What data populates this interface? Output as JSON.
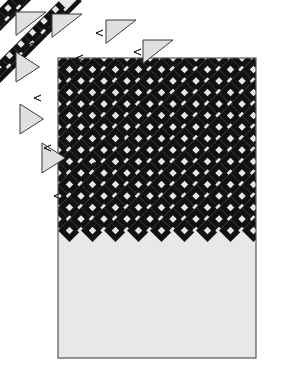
{
  "diagram": {
    "title": "Diagonal-set quilt assembly diagram",
    "kind": "quilt-block-layout",
    "canvas": {
      "width": 285,
      "height": 374
    },
    "colors": {
      "page_background": "#ffffff",
      "quilt_background": "#e8e8e8",
      "patch_dark": "#111111",
      "patch_light": "#e6e6e6",
      "setting_triangle_fill": "#e0e0e0",
      "outline": "#3a3a3a",
      "border": "#555555"
    },
    "quilt_top": {
      "name": "main-quilt-body",
      "x": 58,
      "y": 58,
      "width": 198,
      "height": 300,
      "border_width": 1.2
    },
    "lattice": {
      "description": "45-degree diagonal grid of dark on-point blocks with small light diamonds",
      "cell": 23,
      "diamond_size": 7.5,
      "rows": 13,
      "cols": 9,
      "origin_x": 58,
      "origin_y": 58
    },
    "exploded_rows": [
      {
        "name": "diagonal-row-1",
        "offset_x": -40,
        "offset_y": -40,
        "gap": 9
      },
      {
        "name": "diagonal-row-2",
        "offset_x": -27,
        "offset_y": -27,
        "gap": 9
      },
      {
        "name": "diagonal-row-3",
        "offset_x": -14,
        "offset_y": -14,
        "gap": 9
      }
    ],
    "setting_triangles": [
      {
        "name": "setting-triangle-1",
        "x": 16,
        "y": 12,
        "size": 30,
        "rotation": 0
      },
      {
        "name": "setting-triangle-2",
        "x": 52,
        "y": 14,
        "size": 30,
        "rotation": 0
      },
      {
        "name": "setting-triangle-3",
        "x": 106,
        "y": 20,
        "size": 30,
        "rotation": 0
      },
      {
        "name": "setting-triangle-4",
        "x": 143,
        "y": 40,
        "size": 30,
        "rotation": 0
      },
      {
        "name": "setting-triangle-5",
        "x": 16,
        "y": 52,
        "size": 30,
        "rotation": 1
      },
      {
        "name": "setting-triangle-6",
        "x": 20,
        "y": 104,
        "size": 30,
        "rotation": 1
      },
      {
        "name": "setting-triangle-7",
        "x": 42,
        "y": 143,
        "size": 30,
        "rotation": 1
      }
    ],
    "tick_marks": [
      {
        "name": "seam-tick-1",
        "x": 44,
        "y": 28
      },
      {
        "name": "seam-tick-2",
        "x": 96,
        "y": 33
      },
      {
        "name": "seam-tick-3",
        "x": 134,
        "y": 52
      },
      {
        "name": "seam-tick-4",
        "x": 26,
        "y": 46
      },
      {
        "name": "seam-tick-5",
        "x": 76,
        "y": 58
      },
      {
        "name": "seam-tick-6",
        "x": 126,
        "y": 88
      },
      {
        "name": "seam-tick-7",
        "x": 34,
        "y": 98
      },
      {
        "name": "seam-tick-8",
        "x": 82,
        "y": 112
      },
      {
        "name": "seam-tick-9",
        "x": 118,
        "y": 136
      },
      {
        "name": "seam-tick-10",
        "x": 44,
        "y": 148
      },
      {
        "name": "seam-tick-11",
        "x": 92,
        "y": 164
      },
      {
        "name": "seam-tick-12",
        "x": 54,
        "y": 196
      }
    ]
  }
}
